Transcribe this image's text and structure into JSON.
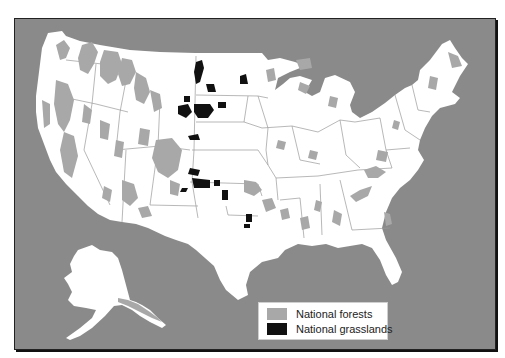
{
  "map": {
    "title": "",
    "region": "United States",
    "colors": {
      "background": "#8a8a8a",
      "land": "#ffffff",
      "state_lines": "#9a9a9a",
      "national_forests": "#a8a8a8",
      "national_grasslands": "#111111"
    }
  },
  "legend": {
    "items": [
      {
        "label": "National forests",
        "color": "#a8a8a8"
      },
      {
        "label": "National grasslands",
        "color": "#111111"
      }
    ]
  }
}
